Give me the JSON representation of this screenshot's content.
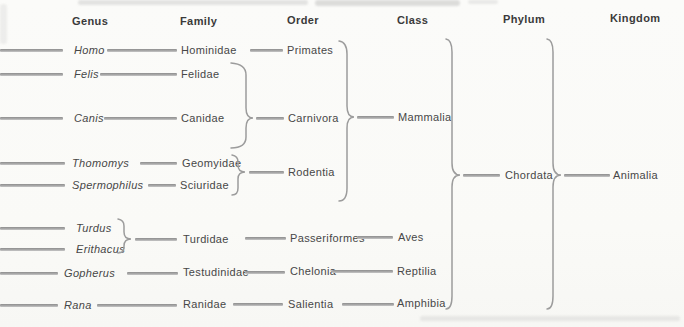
{
  "figure": {
    "type": "taxonomic-hierarchy-diagram",
    "background_color": "#fbfbf9",
    "line_color": "#9c9c9c",
    "text_color": "#454545"
  },
  "headers": {
    "genus": "Genus",
    "family": "Family",
    "order": "Order",
    "class": "Class",
    "phylum": "Phylum",
    "kingdom": "Kingdom"
  },
  "genus": {
    "homo": "Homo",
    "felis": "Felis",
    "canis": "Canis",
    "thomomys": "Thomomys",
    "spermophilus": "Spermophilus",
    "turdus": "Turdus",
    "erithacus": "Erithacus",
    "gopherus": "Gopherus",
    "rana": "Rana"
  },
  "family": {
    "hominidae": "Hominidae",
    "felidae": "Felidae",
    "canidae": "Canidae",
    "geomyidae": "Geomyidae",
    "sciuridae": "Sciuridae",
    "turdidae": "Turdidae",
    "testudinidae": "Testudinidae",
    "ranidae": "Ranidae"
  },
  "order": {
    "primates": "Primates",
    "carnivora": "Carnivora",
    "rodentia": "Rodentia",
    "passeriformes": "Passeriformes",
    "chelonia": "Chelonia",
    "salientia": "Salientia"
  },
  "class": {
    "mammalia": "Mammalia",
    "aves": "Aves",
    "reptilia": "Reptilia",
    "amphibia": "Amphibia"
  },
  "phylum": {
    "chordata": "Chordata"
  },
  "kingdom": {
    "animalia": "Animalia"
  },
  "hierarchy": [
    {
      "genus": "Homo",
      "family": "Hominidae",
      "order": "Primates",
      "class": "Mammalia",
      "phylum": "Chordata",
      "kingdom": "Animalia"
    },
    {
      "genus": "Felis",
      "family": "Felidae",
      "order": "Carnivora",
      "class": "Mammalia",
      "phylum": "Chordata",
      "kingdom": "Animalia"
    },
    {
      "genus": "Canis",
      "family": "Canidae",
      "order": "Carnivora",
      "class": "Mammalia",
      "phylum": "Chordata",
      "kingdom": "Animalia"
    },
    {
      "genus": "Thomomys",
      "family": "Geomyidae",
      "order": "Rodentia",
      "class": "Mammalia",
      "phylum": "Chordata",
      "kingdom": "Animalia"
    },
    {
      "genus": "Spermophilus",
      "family": "Sciuridae",
      "order": "Rodentia",
      "class": "Mammalia",
      "phylum": "Chordata",
      "kingdom": "Animalia"
    },
    {
      "genus": "Turdus",
      "family": "Turdidae",
      "order": "Passeriformes",
      "class": "Aves",
      "phylum": "Chordata",
      "kingdom": "Animalia"
    },
    {
      "genus": "Erithacus",
      "family": "Turdidae",
      "order": "Passeriformes",
      "class": "Aves",
      "phylum": "Chordata",
      "kingdom": "Animalia"
    },
    {
      "genus": "Gopherus",
      "family": "Testudinidae",
      "order": "Chelonia",
      "class": "Reptilia",
      "phylum": "Chordata",
      "kingdom": "Animalia"
    },
    {
      "genus": "Rana",
      "family": "Ranidae",
      "order": "Salientia",
      "class": "Amphibia",
      "phylum": "Chordata",
      "kingdom": "Animalia"
    }
  ]
}
